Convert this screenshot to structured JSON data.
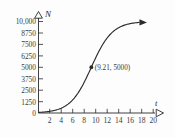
{
  "chart_data": {
    "type": "line",
    "title": "",
    "subtitle": "",
    "xlabel": "t",
    "ylabel": "N",
    "xlim": [
      0,
      22
    ],
    "ylim": [
      0,
      10625
    ],
    "grid": false,
    "legend": null,
    "x_ticks": [
      2,
      4,
      6,
      8,
      10,
      12,
      14,
      16,
      18,
      20
    ],
    "x_tick_labels": [
      "2",
      "4",
      "6",
      "8",
      "10",
      "12",
      "14",
      "16",
      "18",
      "20"
    ],
    "y_ticks": [
      0,
      1250,
      2500,
      3750,
      5000,
      6250,
      7500,
      8750,
      10000
    ],
    "y_tick_labels": [
      "0",
      "1250",
      "2500",
      "3750",
      "5000",
      "6250",
      "7500",
      "8750",
      "10,000"
    ],
    "series": [
      {
        "name": "logistic growth",
        "kind": "logistic",
        "carrying_capacity": 10000,
        "midpoint_t": 9.21,
        "growth_rate": 0.55,
        "x": [
          0,
          1,
          2,
          3,
          4,
          5,
          6,
          7,
          8,
          9,
          9.21,
          10,
          11,
          12,
          13,
          14,
          15,
          16,
          17,
          18
        ],
        "values": [
          62,
          107,
          182,
          310,
          523,
          874,
          1437,
          2297,
          3493,
          4925,
          5000,
          6357,
          7584,
          8481,
          9076,
          9446,
          9670,
          9805,
          9884,
          9931
        ]
      }
    ],
    "annotations": [
      {
        "text": "(9.21, 5000)",
        "point_x": 9.21,
        "point_y": 5000,
        "marker": "dot"
      }
    ],
    "axis_arrows": {
      "x_arrow": "open-triangle",
      "y_arrow": "open-triangle",
      "curve_end_arrow": "solid-arrow"
    },
    "colors": {
      "curve": "#2b2b2b",
      "axis": "#2b2b2b",
      "text": "#3a3a3a",
      "background": "#fdfdfd"
    }
  }
}
